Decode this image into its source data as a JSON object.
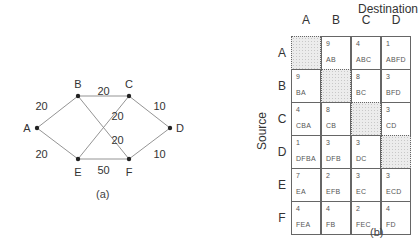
{
  "graph": {
    "caption": "(a)",
    "nodes": [
      {
        "id": "A",
        "x": 37,
        "y": 128
      },
      {
        "id": "B",
        "x": 78,
        "y": 96
      },
      {
        "id": "C",
        "x": 129,
        "y": 96
      },
      {
        "id": "D",
        "x": 170,
        "y": 128
      },
      {
        "id": "E",
        "x": 78,
        "y": 159
      },
      {
        "id": "F",
        "x": 129,
        "y": 159
      }
    ],
    "edges": [
      {
        "from": "A",
        "to": "B",
        "weight": "20"
      },
      {
        "from": "A",
        "to": "E",
        "weight": "20"
      },
      {
        "from": "B",
        "to": "C",
        "weight": "20"
      },
      {
        "from": "B",
        "to": "F",
        "weight": "20"
      },
      {
        "from": "E",
        "to": "C",
        "weight": "20"
      },
      {
        "from": "C",
        "to": "D",
        "weight": "10"
      },
      {
        "from": "F",
        "to": "D",
        "weight": "10"
      },
      {
        "from": "E",
        "to": "F",
        "weight": "50"
      }
    ]
  },
  "table": {
    "caption": "(b)",
    "destination_label": "Destination",
    "source_label": "Source",
    "columns": [
      "A",
      "B",
      "C",
      "D"
    ],
    "rows": [
      {
        "label": "A",
        "cells": [
          null,
          {
            "v": "9",
            "p": "AB"
          },
          {
            "v": "4",
            "p": "ABC"
          },
          {
            "v": "1",
            "p": "ABFD"
          }
        ]
      },
      {
        "label": "B",
        "cells": [
          {
            "v": "9",
            "p": "BA"
          },
          null,
          {
            "v": "8",
            "p": "BC"
          },
          {
            "v": "3",
            "p": "BFD"
          }
        ]
      },
      {
        "label": "C",
        "cells": [
          {
            "v": "4",
            "p": "CBA"
          },
          {
            "v": "8",
            "p": "CB"
          },
          null,
          {
            "v": "3",
            "p": "CD"
          }
        ]
      },
      {
        "label": "D",
        "cells": [
          {
            "v": "1",
            "p": "DFBA"
          },
          {
            "v": "3",
            "p": "DFB"
          },
          {
            "v": "3",
            "p": "DC"
          },
          null
        ]
      },
      {
        "label": "E",
        "cells": [
          {
            "v": "7",
            "p": "EA"
          },
          {
            "v": "2",
            "p": "EFB"
          },
          {
            "v": "3",
            "p": "EC"
          },
          {
            "v": "3",
            "p": "ECD"
          }
        ]
      },
      {
        "label": "F",
        "cells": [
          {
            "v": "4",
            "p": "FEA"
          },
          {
            "v": "4",
            "p": "FB"
          },
          {
            "v": "2",
            "p": "FEC"
          },
          {
            "v": "4",
            "p": "FD"
          }
        ]
      }
    ]
  }
}
